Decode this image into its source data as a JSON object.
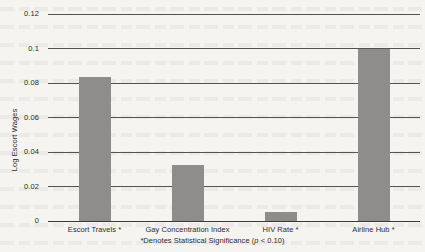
{
  "chart_data": {
    "type": "bar",
    "title": "",
    "subtitle": "",
    "xlabel": "",
    "ylabel": "Log Escort Wages",
    "categories": [
      "Escort Travels *",
      "Gay Concentration Index",
      "HIV Rate *",
      "Airline Hub *"
    ],
    "values": [
      0.0835,
      0.0325,
      0.0055,
      0.1
    ],
    "ylim": [
      0,
      0.12
    ],
    "ytick_labels": [
      "0",
      "0.02",
      "0.04",
      "0.06",
      "0.08",
      "0.1",
      "0.12"
    ],
    "ytick_values": [
      0,
      0.02,
      0.04,
      0.06,
      0.08,
      0.1,
      0.12
    ],
    "grid": true,
    "legend": "none",
    "bar_color": "#8e8d8b",
    "annotations": [
      "*Denotes Statistical Significance (p < 0.10)"
    ]
  },
  "footnote": {
    "prefix": "*Denotes Statistical Significance (",
    "p_symbol": "p",
    "suffix": " < 0.10)"
  }
}
